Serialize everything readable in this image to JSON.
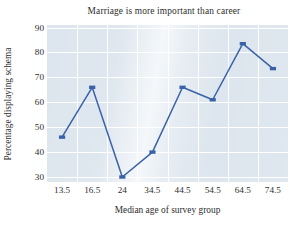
{
  "chart_data": {
    "type": "line",
    "title": "Marriage is more important than career",
    "xlabel": "Median age of survey group",
    "ylabel": "Percentage displaying schema",
    "categories": [
      "13.5",
      "16.5",
      "24",
      "34.5",
      "44.5",
      "54.5",
      "64.5",
      "74.5"
    ],
    "values": [
      46,
      66,
      30,
      40,
      66,
      61,
      83.5,
      73.5
    ],
    "yticks": [
      30,
      40,
      50,
      60,
      70,
      80,
      90
    ],
    "ylim": [
      28,
      91
    ],
    "grid": true,
    "legend": false,
    "series_name": "Percentage displaying schema",
    "marker": "square",
    "colors": {
      "line": "#3a62a8",
      "marker": "#3a62a8",
      "plot_background": "#dbe4ed",
      "gridline": "#ffffff",
      "text": "#2e2e2e",
      "figure_background": "#ffffff"
    }
  }
}
